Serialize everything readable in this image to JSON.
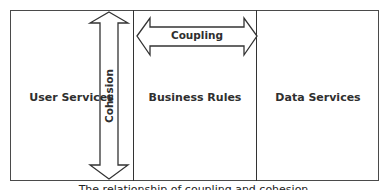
{
  "diagram": {
    "columns": [
      {
        "label": "User Services"
      },
      {
        "label": "Business Rules"
      },
      {
        "label": "Data Services"
      }
    ],
    "arrows": {
      "vertical": {
        "label": "Cohesion",
        "direction": "bidirectional-vertical"
      },
      "horizontal": {
        "label": "Coupling",
        "direction": "bidirectional-horizontal"
      }
    },
    "caption": "The relationship of coupling and cohesion"
  }
}
